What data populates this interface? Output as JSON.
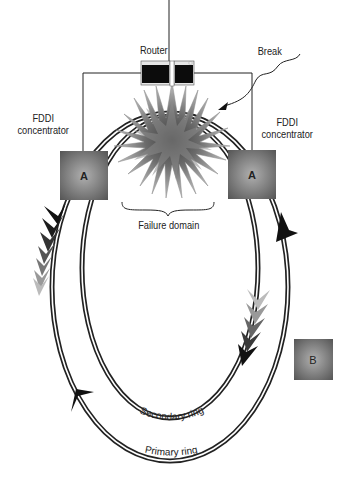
{
  "diagram": {
    "type": "FDDI dual-ring failure diagram",
    "labels": {
      "router": "Router",
      "break": "Break",
      "concentrator_left": [
        "FDDI",
        "concentrator"
      ],
      "concentrator_right": [
        "FDDI",
        "concentrator"
      ],
      "failure_domain": "Failure domain",
      "secondary_ring": "Secondary ring",
      "primary_ring": "Primary ring"
    },
    "nodes": [
      {
        "id": "concentrator-left",
        "label": "A",
        "x": 60,
        "y": 151,
        "w": 48,
        "h": 49
      },
      {
        "id": "concentrator-right",
        "label": "A",
        "x": 228,
        "y": 150,
        "w": 48,
        "h": 49
      },
      {
        "id": "station-b",
        "label": "B",
        "x": 294,
        "y": 339,
        "w": 39,
        "h": 41
      }
    ],
    "rings": [
      {
        "name": "Primary ring",
        "position": "outer"
      },
      {
        "name": "Secondary ring",
        "position": "inner"
      }
    ],
    "colors": {
      "box_dark": "#5a5a5a",
      "box_light": "#a8a8a8",
      "starburst_outer": "#b8b8b8",
      "starburst_inner": "#4a4a4a",
      "line": "#222222",
      "arrow_dark": "#111111",
      "arrow_light": "#bbbbbb"
    }
  }
}
